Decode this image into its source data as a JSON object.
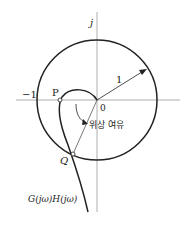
{
  "diagram": {
    "axis_imag_label": "j",
    "neg_one_label": "−1",
    "origin_label": "0",
    "radius_label": "1",
    "point_p_label": "P",
    "point_q_label": "Q",
    "phase_margin_label": "위상 여유",
    "curve_label": "G(jω)H(jω)"
  }
}
